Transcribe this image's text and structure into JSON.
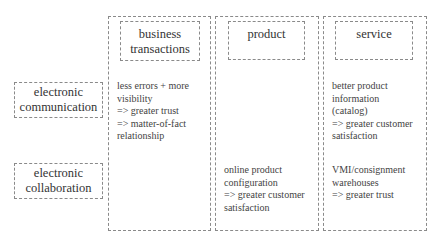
{
  "columns": [
    {
      "label": "business\ntransactions"
    },
    {
      "label": "product"
    },
    {
      "label": "service"
    }
  ],
  "rows": [
    {
      "label": "electronic\ncommunication"
    },
    {
      "label": "electronic\ncollaboration"
    }
  ],
  "cells": {
    "communication_business": "less errors + more\nvisibility\n=> greater trust\n=> matter-of-fact\nrelationship",
    "communication_service": "better product\ninformation\n(catalog)\n=> greater customer\nsatisfaction",
    "collaboration_product": "online product\nconfiguration\n=> greater customer\nsatisfaction",
    "collaboration_service": "VMI/consignment\nwarehouses\n=> greater trust"
  }
}
